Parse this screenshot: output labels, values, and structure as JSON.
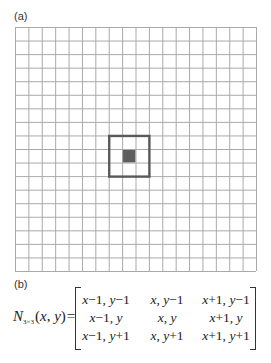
{
  "panel_a": {
    "label": "(a)",
    "grid": {
      "rows": 18,
      "cols": 18,
      "line_color": "#a9a9a9",
      "neighborhood_box": {
        "col_start": 7,
        "row_start": 8,
        "size": 3,
        "stroke_color": "#5a5a5a"
      },
      "center_pixel": {
        "col": 8,
        "row": 9,
        "fill_color": "#5e5e5e"
      }
    }
  },
  "panel_b": {
    "label": "(b)",
    "formula": {
      "lhs_symbol": "N",
      "lhs_subscript": "3×3",
      "lhs_args": "(x, y)",
      "equals": "=",
      "matrix": [
        [
          "x−1, y−1",
          "x, y−1",
          "x+1, y−1"
        ],
        [
          "x−1, y",
          "x, y",
          "x+1, y"
        ],
        [
          "x−1, y+1",
          "x, y+1",
          "x+1, y+1"
        ]
      ]
    }
  }
}
